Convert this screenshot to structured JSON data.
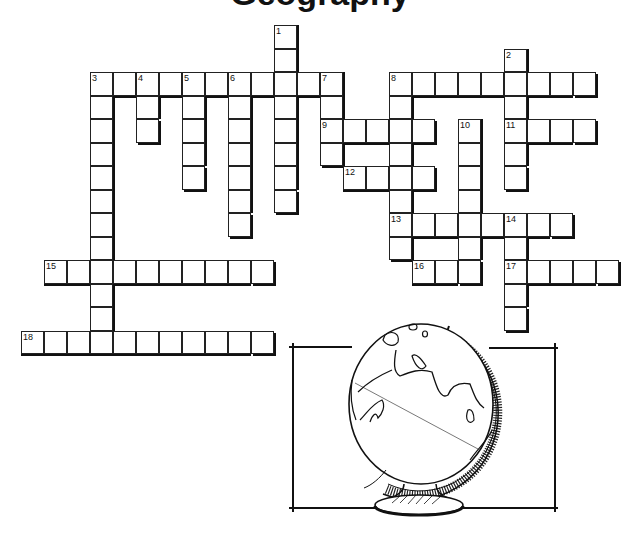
{
  "title": "Geography",
  "puzzle": {
    "origin_x": 21,
    "origin_y": 25,
    "cell_w": 23,
    "cell_h": 23.5,
    "entries": [
      {
        "number": "1",
        "direction": "down",
        "col": 11,
        "row": 0,
        "length": 8
      },
      {
        "number": "2",
        "direction": "down",
        "col": 21,
        "row": 1,
        "length": 6
      },
      {
        "number": "3",
        "direction": "across",
        "col": 3,
        "row": 2,
        "length": 11
      },
      {
        "number": "3",
        "direction": "down",
        "col": 3,
        "row": 2,
        "length": 12
      },
      {
        "number": "4",
        "direction": "down",
        "col": 5,
        "row": 2,
        "length": 3
      },
      {
        "number": "5",
        "direction": "down",
        "col": 7,
        "row": 2,
        "length": 5
      },
      {
        "number": "6",
        "direction": "down",
        "col": 9,
        "row": 2,
        "length": 7
      },
      {
        "number": "7",
        "direction": "down",
        "col": 13,
        "row": 2,
        "length": 4
      },
      {
        "number": "8",
        "direction": "across",
        "col": 16,
        "row": 2,
        "length": 9
      },
      {
        "number": "8",
        "direction": "down",
        "col": 16,
        "row": 2,
        "length": 8
      },
      {
        "number": "9",
        "direction": "across",
        "col": 13,
        "row": 4,
        "length": 5
      },
      {
        "number": "10",
        "direction": "down",
        "col": 19,
        "row": 4,
        "length": 7
      },
      {
        "number": "11",
        "direction": "across",
        "col": 21,
        "row": 4,
        "length": 4
      },
      {
        "number": "12",
        "direction": "across",
        "col": 14,
        "row": 6,
        "length": 4
      },
      {
        "number": "13",
        "direction": "across",
        "col": 16,
        "row": 8,
        "length": 8
      },
      {
        "number": "14",
        "direction": "down",
        "col": 21,
        "row": 8,
        "length": 5
      },
      {
        "number": "15",
        "direction": "across",
        "col": 1,
        "row": 10,
        "length": 10
      },
      {
        "number": "16",
        "direction": "across",
        "col": 17,
        "row": 10,
        "length": 3
      },
      {
        "number": "17",
        "direction": "across",
        "col": 21,
        "row": 10,
        "length": 5
      },
      {
        "number": "18",
        "direction": "across",
        "col": 0,
        "row": 13,
        "length": 11
      }
    ]
  },
  "illustration": {
    "subject": "globe-on-stand",
    "frame": {
      "x": 293,
      "y": 347,
      "w": 262,
      "h": 161
    }
  },
  "colors": {
    "ink": "#111111",
    "paper": "#ffffff"
  }
}
